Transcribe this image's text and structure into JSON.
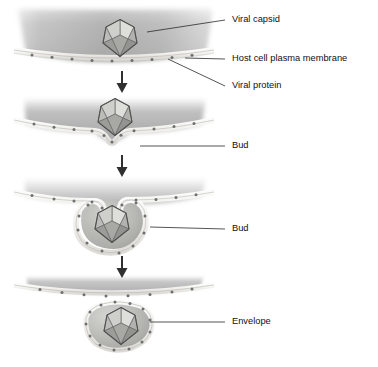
{
  "diagram": {
    "type": "process-sequence",
    "panel_count": 4,
    "colors": {
      "cytoplasm_dark": "#a8a8a8",
      "cytoplasm_light": "#e8e8e8",
      "membrane_fill": "#f2f1ee",
      "membrane_stroke": "#b9b8b4",
      "protein_dot": "#6f6f6f",
      "capsid_light": "#d9d9d6",
      "capsid_mid": "#b5b5b2",
      "capsid_dark": "#8f8f8d",
      "capsid_stroke": "#5a5a58",
      "label_text": "#111111",
      "leader_line": "#2a2a2a",
      "arrow": "#303030",
      "background": "#ffffff"
    },
    "labels": [
      {
        "id": "viral-capsid",
        "text": "Viral capsid",
        "x": 232,
        "y": 20
      },
      {
        "id": "host-cell-membrane",
        "text": "Host cell plasma membrane",
        "x": 232,
        "y": 59
      },
      {
        "id": "viral-protein",
        "text": "Viral protein",
        "x": 232,
        "y": 86
      },
      {
        "id": "bud-upper",
        "text": "Bud",
        "x": 232,
        "y": 146
      },
      {
        "id": "bud-lower",
        "text": "Bud",
        "x": 232,
        "y": 229
      },
      {
        "id": "envelope",
        "text": "Envelope",
        "x": 232,
        "y": 322
      }
    ],
    "panels": [
      {
        "id": "panel-1-capsid-at-membrane",
        "stage": 1,
        "caption": "Viral capsid approaches host cell plasma membrane studded with viral protein"
      },
      {
        "id": "panel-2-early-bud",
        "stage": 2,
        "caption": "Membrane begins to dimple around the capsid forming an early bud"
      },
      {
        "id": "panel-3-deep-bud",
        "stage": 3,
        "caption": "Capsid is enclosed in a deep bud with a narrow membrane neck"
      },
      {
        "id": "panel-4-released-virion",
        "stage": 4,
        "caption": "Enveloped virion is released and the membrane reseals"
      }
    ],
    "arrows": [
      {
        "id": "arrow-1",
        "from_panel": 1,
        "to_panel": 2,
        "direction": "down"
      },
      {
        "id": "arrow-2",
        "from_panel": 2,
        "to_panel": 3,
        "direction": "down"
      },
      {
        "id": "arrow-3",
        "from_panel": 3,
        "to_panel": 4,
        "direction": "down"
      }
    ]
  }
}
